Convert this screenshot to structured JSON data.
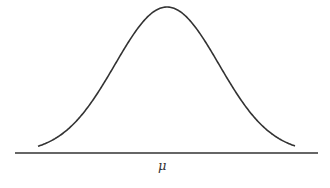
{
  "chart_data": {
    "type": "line",
    "title": "",
    "xlabel": "",
    "ylabel": "",
    "x_tick_labels": [
      "μ"
    ],
    "series": [
      {
        "name": "normal density",
        "mean_px": 167,
        "sigma_px": 52,
        "peak_y_px": 7,
        "baseline_y_px": 153,
        "x_start_px": 38,
        "x_end_px": 295
      }
    ],
    "axis": {
      "x_start_px": 15,
      "x_end_px": 318
    },
    "grid": false,
    "legend": null,
    "colors": {
      "line": "#333333",
      "axis": "#333333"
    }
  },
  "labels": {
    "mean": "μ"
  }
}
